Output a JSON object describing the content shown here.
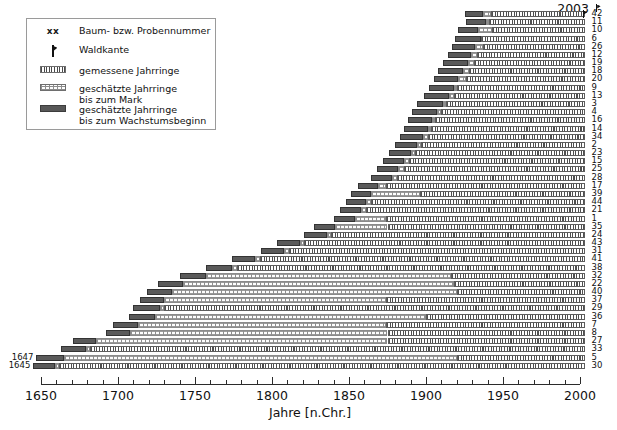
{
  "chart_data": {
    "type": "bar",
    "title": "",
    "xlabel": "Jahre [n.Chr.]",
    "ylabel": "",
    "xlim": [
      1645,
      2006
    ],
    "xticks": [
      1650,
      1700,
      1750,
      1800,
      1850,
      1900,
      1950,
      2000
    ],
    "xtick_labels": [
      "1650",
      "1700",
      "1750",
      "1800",
      "1850",
      "1900",
      "1950",
      "2000"
    ],
    "minor_tick_step": 10,
    "grid": false,
    "legend_position": "upper-left",
    "end_year_annotation": "2003",
    "orientation": "horizontal",
    "series_note": "Each bar = one tree/sample; segments: estimated rings to growth start (dark), estimated rings to pith (dotted), measured rings (hatched). Waldkante marker shown where bark edge preserved.",
    "bars": [
      {
        "sample": "42",
        "start": 1925,
        "pith_start": 1937,
        "measured_start": 1942,
        "end": 2003,
        "waldkante": true,
        "left_label": ""
      },
      {
        "sample": "11",
        "start": 1926,
        "pith_start": 1939,
        "measured_start": 1941,
        "end": 2003,
        "waldkante": false,
        "left_label": ""
      },
      {
        "sample": "10",
        "start": 1921,
        "pith_start": 1934,
        "measured_start": 1943,
        "end": 2003,
        "waldkante": false,
        "left_label": ""
      },
      {
        "sample": "6",
        "start": 1919,
        "pith_start": 1936,
        "measured_start": 1936,
        "end": 2003,
        "waldkante": false,
        "left_label": ""
      },
      {
        "sample": "26",
        "start": 1917,
        "pith_start": 1932,
        "measured_start": 1937,
        "end": 2003,
        "waldkante": false,
        "left_label": ""
      },
      {
        "sample": "12",
        "start": 1914,
        "pith_start": 1929,
        "measured_start": 1933,
        "end": 2003,
        "waldkante": false,
        "left_label": ""
      },
      {
        "sample": "19",
        "start": 1911,
        "pith_start": 1927,
        "measured_start": 1931,
        "end": 2003,
        "waldkante": false,
        "left_label": ""
      },
      {
        "sample": "18",
        "start": 1908,
        "pith_start": 1924,
        "measured_start": 1928,
        "end": 2003,
        "waldkante": false,
        "left_label": ""
      },
      {
        "sample": "20",
        "start": 1905,
        "pith_start": 1921,
        "measured_start": 1926,
        "end": 2003,
        "waldkante": false,
        "left_label": ""
      },
      {
        "sample": "9",
        "start": 1902,
        "pith_start": 1918,
        "measured_start": 1920,
        "end": 2003,
        "waldkante": false,
        "left_label": ""
      },
      {
        "sample": "13",
        "start": 1899,
        "pith_start": 1915,
        "measured_start": 1918,
        "end": 2003,
        "waldkante": false,
        "left_label": ""
      },
      {
        "sample": "3",
        "start": 1894,
        "pith_start": 1911,
        "measured_start": 1913,
        "end": 2003,
        "waldkante": false,
        "left_label": ""
      },
      {
        "sample": "4",
        "start": 1891,
        "pith_start": 1907,
        "measured_start": 1910,
        "end": 2003,
        "waldkante": false,
        "left_label": ""
      },
      {
        "sample": "16",
        "start": 1888,
        "pith_start": 1904,
        "measured_start": 1906,
        "end": 2003,
        "waldkante": false,
        "left_label": ""
      },
      {
        "sample": "14",
        "start": 1886,
        "pith_start": 1901,
        "measured_start": 1903,
        "end": 2003,
        "waldkante": false,
        "left_label": ""
      },
      {
        "sample": "34",
        "start": 1883,
        "pith_start": 1898,
        "measured_start": 1901,
        "end": 2003,
        "waldkante": false,
        "left_label": ""
      },
      {
        "sample": "2",
        "start": 1880,
        "pith_start": 1894,
        "measured_start": 1897,
        "end": 2003,
        "waldkante": false,
        "left_label": ""
      },
      {
        "sample": "23",
        "start": 1876,
        "pith_start": 1890,
        "measured_start": 1893,
        "end": 2003,
        "waldkante": false,
        "left_label": ""
      },
      {
        "sample": "15",
        "start": 1872,
        "pith_start": 1886,
        "measured_start": 1889,
        "end": 2003,
        "waldkante": false,
        "left_label": ""
      },
      {
        "sample": "25",
        "start": 1868,
        "pith_start": 1882,
        "measured_start": 1886,
        "end": 2003,
        "waldkante": false,
        "left_label": ""
      },
      {
        "sample": "28",
        "start": 1864,
        "pith_start": 1878,
        "measured_start": 1881,
        "end": 2003,
        "waldkante": false,
        "left_label": ""
      },
      {
        "sample": "17",
        "start": 1856,
        "pith_start": 1869,
        "measured_start": 1874,
        "end": 2003,
        "waldkante": false,
        "left_label": ""
      },
      {
        "sample": "39",
        "start": 1851,
        "pith_start": 1864,
        "measured_start": 1896,
        "end": 2003,
        "waldkante": false,
        "left_label": ""
      },
      {
        "sample": "44",
        "start": 1848,
        "pith_start": 1861,
        "measured_start": 1864,
        "end": 2003,
        "waldkante": false,
        "left_label": ""
      },
      {
        "sample": "21",
        "start": 1844,
        "pith_start": 1858,
        "measured_start": 1861,
        "end": 2003,
        "waldkante": false,
        "left_label": ""
      },
      {
        "sample": "1",
        "start": 1840,
        "pith_start": 1854,
        "measured_start": 1874,
        "end": 2003,
        "waldkante": false,
        "left_label": ""
      },
      {
        "sample": "35",
        "start": 1827,
        "pith_start": 1841,
        "measured_start": 1875,
        "end": 2003,
        "waldkante": false,
        "left_label": ""
      },
      {
        "sample": "24",
        "start": 1821,
        "pith_start": 1836,
        "measured_start": 1838,
        "end": 2003,
        "waldkante": false,
        "left_label": ""
      },
      {
        "sample": "43",
        "start": 1803,
        "pith_start": 1818,
        "measured_start": 1821,
        "end": 2003,
        "waldkante": false,
        "left_label": ""
      },
      {
        "sample": "31",
        "start": 1793,
        "pith_start": 1808,
        "measured_start": 1811,
        "end": 2003,
        "waldkante": false,
        "left_label": ""
      },
      {
        "sample": "41",
        "start": 1774,
        "pith_start": 1789,
        "measured_start": 1792,
        "end": 2003,
        "waldkante": false,
        "left_label": ""
      },
      {
        "sample": "38",
        "start": 1757,
        "pith_start": 1774,
        "measured_start": 1777,
        "end": 2003,
        "waldkante": false,
        "left_label": ""
      },
      {
        "sample": "32",
        "start": 1740,
        "pith_start": 1757,
        "measured_start": 1916,
        "end": 2003,
        "waldkante": false,
        "left_label": ""
      },
      {
        "sample": "22",
        "start": 1726,
        "pith_start": 1742,
        "measured_start": 1918,
        "end": 2003,
        "waldkante": false,
        "left_label": ""
      },
      {
        "sample": "40",
        "start": 1719,
        "pith_start": 1735,
        "measured_start": 1920,
        "end": 2003,
        "waldkante": false,
        "left_label": ""
      },
      {
        "sample": "37",
        "start": 1714,
        "pith_start": 1730,
        "measured_start": 1874,
        "end": 2003,
        "waldkante": false,
        "left_label": ""
      },
      {
        "sample": "29",
        "start": 1710,
        "pith_start": 1727,
        "measured_start": 1730,
        "end": 2003,
        "waldkante": false,
        "left_label": ""
      },
      {
        "sample": "36",
        "start": 1707,
        "pith_start": 1724,
        "measured_start": 1900,
        "end": 2003,
        "waldkante": false,
        "left_label": ""
      },
      {
        "sample": "7",
        "start": 1697,
        "pith_start": 1713,
        "measured_start": 1874,
        "end": 2003,
        "waldkante": false,
        "left_label": ""
      },
      {
        "sample": "8",
        "start": 1692,
        "pith_start": 1708,
        "measured_start": 1875,
        "end": 2003,
        "waldkante": false,
        "left_label": ""
      },
      {
        "sample": "27",
        "start": 1671,
        "pith_start": 1686,
        "measured_start": 1875,
        "end": 2003,
        "waldkante": false,
        "left_label": ""
      },
      {
        "sample": "33",
        "start": 1663,
        "pith_start": 1679,
        "measured_start": 1682,
        "end": 2003,
        "waldkante": false,
        "left_label": ""
      },
      {
        "sample": "5",
        "start": 1647,
        "pith_start": 1665,
        "measured_start": 1920,
        "end": 2003,
        "waldkante": false,
        "left_label": "1647"
      },
      {
        "sample": "30",
        "start": 1645,
        "pith_start": 1659,
        "measured_start": 1662,
        "end": 2003,
        "waldkante": false,
        "left_label": "1645"
      }
    ]
  },
  "legend": {
    "items": [
      {
        "key": "xx",
        "label": "Baum- bzw. Probennummer"
      },
      {
        "key": "waldkante",
        "label": "Waldkante"
      },
      {
        "key": "measured",
        "label": "gemessene Jahrringe"
      },
      {
        "key": "pith",
        "label": "geschätzte Jahrringe\nbis zum Mark"
      },
      {
        "key": "growth-start",
        "label": "geschätzte Jahrringe\nbis zum Wachstumsbeginn"
      }
    ]
  },
  "colors": {
    "growth_start": "#5a5a5a",
    "pith": "#fdfdfd",
    "measured": "#ffffff",
    "hatch": "#4f4f4f",
    "axis": "#2b2b2b",
    "text": "#111111"
  }
}
